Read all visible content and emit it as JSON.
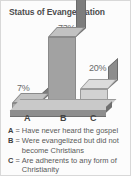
{
  "figure": {
    "title": "Status of Evangelization"
  },
  "chart_data": {
    "type": "bar",
    "title": "Status of Evangelization",
    "categories": [
      "A",
      "B",
      "C"
    ],
    "values": [
      7,
      73,
      20
    ],
    "data_labels": [
      "7%",
      "20%",
      "73%"
    ],
    "value_labels": {
      "A": "7%",
      "B": "73%",
      "C": "20%"
    },
    "category_descriptions": {
      "A": "Have never heard the gospel",
      "B": "Were evangelized but did not become Christians",
      "C": "Are adherents to any form of Christianity"
    },
    "xlabel": "",
    "ylabel": "",
    "ylim": [
      0,
      100
    ],
    "grid": false,
    "legend": "below-axis",
    "style": "3d-isometric-grayscale",
    "unit": "percent"
  },
  "axis": {
    "ticks": [
      "A",
      "B",
      "C"
    ]
  },
  "legend": {
    "equals": "=",
    "rows": [
      {
        "key": "A",
        "text": "Have never heard the gospel"
      },
      {
        "key": "B",
        "text": "Were evangelized but did not become Christians"
      },
      {
        "key": "C",
        "text": "Are adherents to any form of Christianity"
      }
    ]
  },
  "colors": {
    "bar_front": "#a9a9a9",
    "bar_top": "#c2c2c2",
    "bar_side": "#7d7d7d",
    "bar_c_front": "#d2d2d2",
    "base": "#8e8e8e",
    "text": "#5a5a5a",
    "border": "#d8d8d8"
  }
}
